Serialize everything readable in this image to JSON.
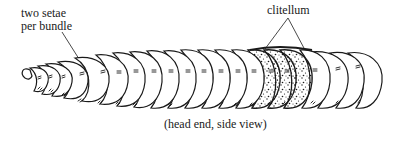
{
  "diagram": {
    "labels": {
      "setae_line1": "two setae",
      "setae_line2": "per bundle",
      "clitellum": "clitellum",
      "caption": "(head end, side view)"
    },
    "segments_visible": 21,
    "clitellum_segments": [
      15,
      16,
      17
    ],
    "colors": {
      "ink": "#1a1a1a",
      "background": "#ffffff"
    }
  }
}
